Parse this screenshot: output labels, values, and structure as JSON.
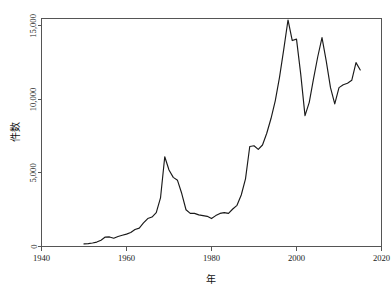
{
  "chart_data": {
    "type": "line",
    "title": "",
    "subtitle": "",
    "xlabel": "年",
    "ylabel": "件数",
    "xlim": [
      1940,
      2020
    ],
    "ylim": [
      0,
      15500
    ],
    "grid": false,
    "legend": "none",
    "x_ticks": [
      "1940",
      "1960",
      "1980",
      "2000",
      "2020"
    ],
    "x_tick_values": [
      1940,
      1960,
      1980,
      2000,
      2020
    ],
    "y_ticks": [
      "0",
      "5,000",
      "10,000",
      "15,000"
    ],
    "y_tick_values": [
      0,
      5000,
      10000,
      15000
    ],
    "series": [
      {
        "name": "件数",
        "color": "#1a1a1a",
        "x": [
          1950,
          1951,
          1952,
          1953,
          1954,
          1955,
          1956,
          1957,
          1958,
          1959,
          1960,
          1961,
          1962,
          1963,
          1964,
          1965,
          1966,
          1967,
          1968,
          1969,
          1970,
          1971,
          1972,
          1973,
          1974,
          1975,
          1976,
          1977,
          1978,
          1979,
          1980,
          1981,
          1982,
          1983,
          1984,
          1985,
          1986,
          1987,
          1988,
          1989,
          1990,
          1991,
          1992,
          1993,
          1994,
          1995,
          1996,
          1997,
          1998,
          1999,
          2000,
          2001,
          2002,
          2003,
          2004,
          2005,
          2006,
          2007,
          2008,
          2009,
          2010,
          2011,
          2012,
          2013,
          2014,
          2015
        ],
        "values": [
          180,
          200,
          240,
          300,
          430,
          640,
          650,
          560,
          680,
          760,
          840,
          950,
          1150,
          1250,
          1600,
          1900,
          2000,
          2300,
          3300,
          6100,
          5200,
          4700,
          4500,
          3600,
          2500,
          2250,
          2250,
          2150,
          2100,
          2050,
          1900,
          2100,
          2250,
          2300,
          2250,
          2550,
          2800,
          3500,
          4600,
          6800,
          6850,
          6600,
          6900,
          7700,
          8700,
          9900,
          11500,
          13400,
          15400,
          14000,
          14100,
          11700,
          8900,
          9800,
          11400,
          12900,
          14200,
          12600,
          10800,
          9700,
          10800,
          11000,
          11100,
          11300,
          12500,
          12000
        ]
      }
    ],
    "annotations": [],
    "min_value": 180,
    "max_value": 15400,
    "peak_year": 1998,
    "start_year": 1950,
    "end_year": 2015
  }
}
